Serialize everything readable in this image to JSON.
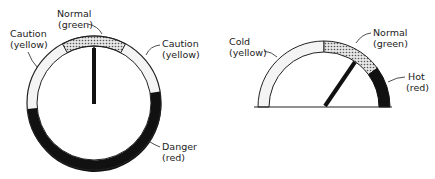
{
  "left_gauge": {
    "labels": {
      "normal": [
        "Normal",
        "(green)"
      ],
      "caution_left": [
        "Caution",
        "(yellow)"
      ],
      "caution_right": [
        "Caution",
        "(yellow)"
      ],
      "danger": [
        "Danger",
        "(red)"
      ]
    }
  },
  "right_gauge": {
    "labels": {
      "cold": [
        "Cold",
        "(yellow)"
      ],
      "normal": [
        "Normal",
        "(green)"
      ],
      "hot": [
        "Hot",
        "(red)"
      ]
    }
  }
}
